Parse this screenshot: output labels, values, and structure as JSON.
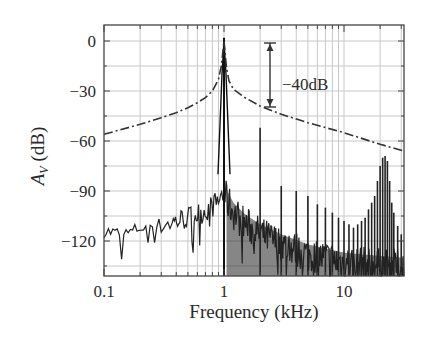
{
  "chart_data": {
    "type": "line",
    "title": "",
    "xlabel": "Frequency (kHz)",
    "ylabel": "A_V (dB)",
    "ylabel_main": "A",
    "ylabel_sub": "V",
    "ylabel_unit": " (dB)",
    "xscale": "log",
    "xlim": [
      0.1,
      31.6
    ],
    "ylim": [
      -141,
      9.6
    ],
    "grid": true,
    "legend": null,
    "x_ticks": [
      0.1,
      1,
      10
    ],
    "x_tick_labels": [
      "0.1",
      "1",
      "10"
    ],
    "y_ticks": [
      0,
      -30,
      -60,
      -90,
      -120
    ],
    "y_tick_labels": [
      "0",
      "−30",
      "−60",
      "−90",
      "−120"
    ],
    "annotations": [
      {
        "text": "−40dB",
        "type": "double-arrow",
        "x_khz": 2.3,
        "from_db": -1,
        "to_db": -40
      }
    ],
    "series": [
      {
        "name": "Filter response (dash-dot)",
        "style": "dash-dot",
        "x": [
          0.1,
          0.2,
          0.3,
          0.4,
          0.5,
          0.6,
          0.7,
          0.8,
          0.9,
          0.95,
          1.0,
          1.05,
          1.1,
          1.2,
          1.5,
          2.0,
          3.0,
          5.0,
          10.0,
          20.0,
          31.6
        ],
        "y": [
          -56,
          -50,
          -46,
          -43,
          -40,
          -37,
          -34,
          -30,
          -23,
          -15,
          0,
          -16,
          -24,
          -29,
          -34,
          -39,
          -44,
          -49,
          -55,
          -62,
          -66
        ]
      },
      {
        "name": "Measured spectrum (solid)",
        "style": "solid",
        "fundamental": {
          "x": 1.0,
          "y": 2
        },
        "harmonics": [
          {
            "x": 2.0,
            "y": -52
          },
          {
            "x": 3.0,
            "y": -87
          },
          {
            "x": 4.0,
            "y": -90
          },
          {
            "x": 5.0,
            "y": -93
          },
          {
            "x": 6.0,
            "y": -98
          },
          {
            "x": 7.0,
            "y": -100
          },
          {
            "x": 8.0,
            "y": -103
          },
          {
            "x": 9.0,
            "y": -106
          },
          {
            "x": 10.0,
            "y": -108
          },
          {
            "x": 11.0,
            "y": -110
          },
          {
            "x": 12.0,
            "y": -112
          },
          {
            "x": 13.0,
            "y": -110
          },
          {
            "x": 14.0,
            "y": -108
          },
          {
            "x": 15.0,
            "y": -106
          },
          {
            "x": 16.0,
            "y": -101
          },
          {
            "x": 17.0,
            "y": -97
          },
          {
            "x": 18.0,
            "y": -93
          },
          {
            "x": 19.0,
            "y": -84
          },
          {
            "x": 20.0,
            "y": -75
          },
          {
            "x": 21.0,
            "y": -70
          },
          {
            "x": 22.0,
            "y": -69
          },
          {
            "x": 23.0,
            "y": -72
          },
          {
            "x": 24.0,
            "y": -84
          },
          {
            "x": 25.0,
            "y": -97
          },
          {
            "x": 26.0,
            "y": -103
          },
          {
            "x": 28.0,
            "y": -111
          },
          {
            "x": 30.0,
            "y": -116
          }
        ],
        "noise_floor": {
          "x": [
            0.1,
            0.15,
            0.2,
            0.3,
            0.4,
            0.5,
            0.6,
            0.7,
            0.8,
            0.9,
            0.95,
            1.05,
            1.2,
            1.5,
            2.0,
            3.0,
            5.0,
            10.0,
            20.0,
            31.6
          ],
          "y": [
            -114,
            -116,
            -112,
            -110,
            -108,
            -106,
            -104,
            -102,
            -99,
            -96,
            -92,
            -95,
            -103,
            -110,
            -116,
            -122,
            -128,
            -133,
            -135,
            -136
          ]
        }
      }
    ]
  }
}
